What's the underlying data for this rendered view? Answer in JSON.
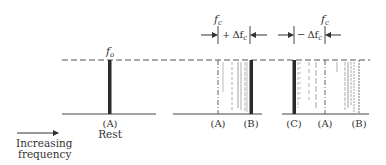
{
  "diagram": {
    "type": "doppler-spectrum-shift",
    "colors": {
      "ink": "#333333",
      "thick_bar": "#2a2a2a",
      "faint": "#9a9a9a",
      "background": "#ffffff"
    },
    "axis_legend": {
      "arrow": "right-arrow",
      "line1": "Increasing",
      "line2": "frequency"
    },
    "panels": [
      {
        "id": "rest",
        "top_label": "f",
        "top_label_sub": "o",
        "lines": [
          {
            "label": "(A)",
            "style": "thick"
          }
        ],
        "caption": "Rest"
      },
      {
        "id": "positive-shift",
        "top_label": "f",
        "top_label_sub": "c",
        "shift_label_sign": "+",
        "shift_label": "Δf",
        "shift_label_sub": "c",
        "lines": [
          {
            "label": "(A)",
            "style": "dashed"
          },
          {
            "label": "(B)",
            "style": "thick"
          }
        ]
      },
      {
        "id": "negative-shift",
        "top_label": "f",
        "top_label_sub": "c",
        "shift_label_sign": "−",
        "shift_label": "Δf",
        "shift_label_sub": "c",
        "lines": [
          {
            "label": "(C)",
            "style": "thick"
          },
          {
            "label": "(A)",
            "style": "dashed"
          },
          {
            "label": "(B)",
            "style": "dashed"
          }
        ]
      }
    ]
  }
}
